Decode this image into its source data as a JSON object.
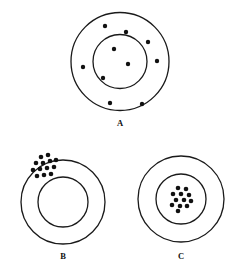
{
  "figure": {
    "width": 246,
    "height": 274,
    "background_color": "#ffffff",
    "stroke_color": "#1a1a1a",
    "dot_color": "#111111",
    "label_font_weight": "bold"
  },
  "panels": [
    {
      "id": "panel-a",
      "label": "A",
      "label_x": 120,
      "label_y": 126,
      "description": "Dots dispersed evenly throughout both the outer annulus and the inner circle",
      "center_x": 120,
      "center_y": 61.5,
      "outer_radius": 49,
      "inner_radius": 27,
      "outer_stroke_width": 1.3,
      "inner_stroke_width": 1.3,
      "dot_radius": 2.2,
      "dot_count": 9,
      "dots": [
        {
          "x": 105,
          "y": 26
        },
        {
          "x": 126,
          "y": 32
        },
        {
          "x": 148,
          "y": 42
        },
        {
          "x": 114,
          "y": 49
        },
        {
          "x": 157,
          "y": 61
        },
        {
          "x": 83,
          "y": 67
        },
        {
          "x": 128,
          "y": 64
        },
        {
          "x": 103,
          "y": 78
        },
        {
          "x": 110,
          "y": 103
        },
        {
          "x": 142,
          "y": 104
        }
      ]
    },
    {
      "id": "panel-b",
      "label": "B",
      "label_x": 63,
      "label_y": 259,
      "description": "Dots tightly clustered in the upper-left portion of the outer annulus",
      "center_x": 63,
      "center_y": 202,
      "outer_radius": 42,
      "inner_radius": 25,
      "outer_stroke_width": 1.3,
      "inner_stroke_width": 1.3,
      "dot_radius": 2.3,
      "dot_count": 13,
      "dots": [
        {
          "x": 41,
          "y": 157
        },
        {
          "x": 48,
          "y": 155
        },
        {
          "x": 36,
          "y": 163
        },
        {
          "x": 43,
          "y": 163
        },
        {
          "x": 50,
          "y": 161
        },
        {
          "x": 56,
          "y": 160
        },
        {
          "x": 33,
          "y": 170
        },
        {
          "x": 40,
          "y": 169
        },
        {
          "x": 47,
          "y": 168
        },
        {
          "x": 54,
          "y": 167
        },
        {
          "x": 37,
          "y": 176
        },
        {
          "x": 44,
          "y": 175
        },
        {
          "x": 51,
          "y": 174
        }
      ]
    },
    {
      "id": "panel-c",
      "label": "C",
      "label_x": 181,
      "label_y": 259,
      "description": "Dots tightly clustered at the centre, entirely inside the inner circle",
      "center_x": 181,
      "center_y": 199,
      "outer_radius": 43,
      "inner_radius": 25,
      "outer_stroke_width": 1.3,
      "inner_stroke_width": 1.3,
      "dot_radius": 2.3,
      "dot_count": 12,
      "dots": [
        {
          "x": 178,
          "y": 188
        },
        {
          "x": 186,
          "y": 189
        },
        {
          "x": 173,
          "y": 194
        },
        {
          "x": 181,
          "y": 194
        },
        {
          "x": 189,
          "y": 195
        },
        {
          "x": 176,
          "y": 200
        },
        {
          "x": 184,
          "y": 200
        },
        {
          "x": 191,
          "y": 201
        },
        {
          "x": 172,
          "y": 205
        },
        {
          "x": 180,
          "y": 206
        },
        {
          "x": 187,
          "y": 206
        },
        {
          "x": 178,
          "y": 211
        }
      ]
    }
  ]
}
